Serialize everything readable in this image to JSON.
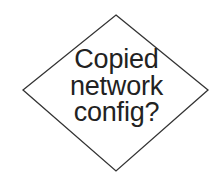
{
  "diagram": {
    "type": "flowchart-decision",
    "node": {
      "shape": "diamond",
      "label_lines": [
        "Copied",
        "network",
        "config?"
      ],
      "stroke_color": "#333333",
      "fill_color": "#ffffff",
      "text_color": "#222222"
    }
  }
}
